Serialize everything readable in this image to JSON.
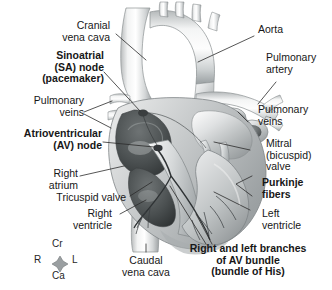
{
  "figure": {
    "background_color": "#ffffff",
    "text_color": "#171717",
    "illustration_style": "grayscale airbrush anatomical rendering"
  },
  "labels_left": [
    {
      "id": "cranial-vena-cava",
      "lines": [
        "Cranial",
        "vena cava"
      ],
      "bold": false
    },
    {
      "id": "sa-node",
      "lines": [
        "Sinoatrial",
        "(SA) node",
        "(pacemaker)"
      ],
      "bold": true
    },
    {
      "id": "pulmonary-veins-left",
      "lines": [
        "Pulmonary",
        "veins"
      ],
      "bold": false
    },
    {
      "id": "av-node",
      "lines": [
        "Atrioventricular",
        "(AV) node"
      ],
      "bold": true
    },
    {
      "id": "right-atrium",
      "lines": [
        "Right",
        "atrium"
      ],
      "bold": false
    },
    {
      "id": "tricuspid-valve",
      "lines": [
        "Tricuspid valve"
      ],
      "bold": false
    },
    {
      "id": "right-ventricle",
      "lines": [
        "Right",
        "ventricle"
      ],
      "bold": false
    }
  ],
  "labels_right": [
    {
      "id": "aorta",
      "lines": [
        "Aorta"
      ],
      "bold": false
    },
    {
      "id": "pulmonary-artery",
      "lines": [
        "Pulmonary",
        "artery"
      ],
      "bold": false
    },
    {
      "id": "pulmonary-veins-right",
      "lines": [
        "Pulmonary",
        "veins"
      ],
      "bold": false
    },
    {
      "id": "mitral-valve",
      "lines": [
        "Mitral",
        "(bicuspid)",
        "valve"
      ],
      "bold": false
    },
    {
      "id": "purkinje-fibers",
      "lines": [
        "Purkinje",
        "fibers"
      ],
      "bold": true
    },
    {
      "id": "left-ventricle",
      "lines": [
        "Left",
        "ventricle"
      ],
      "bold": false
    }
  ],
  "labels_bottom": [
    {
      "id": "caudal-vena-cava",
      "lines": [
        "Caudal",
        "vena cava"
      ],
      "bold": false
    },
    {
      "id": "av-bundle-branches",
      "lines": [
        "Right and left branches",
        "of AV bundle",
        "(bundle of His)"
      ],
      "bold": true
    }
  ],
  "orientation_compass": {
    "id": "orientation-compass",
    "top": "Cr",
    "bottom": "Ca",
    "left": "R",
    "right": "L"
  }
}
